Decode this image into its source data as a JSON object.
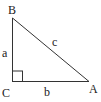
{
  "diagram": {
    "type": "right-triangle",
    "vertices": [
      {
        "id": "B",
        "label": "B",
        "x": 12,
        "y": 18
      },
      {
        "id": "C",
        "label": "C",
        "x": 12,
        "y": 81
      },
      {
        "id": "A",
        "label": "A",
        "x": 89,
        "y": 81
      }
    ],
    "sides": [
      {
        "id": "a",
        "label": "a",
        "from": "B",
        "to": "C"
      },
      {
        "id": "b",
        "label": "b",
        "from": "C",
        "to": "A"
      },
      {
        "id": "c",
        "label": "c",
        "from": "B",
        "to": "A"
      }
    ],
    "right_angle_at": "C",
    "stroke_color": "#333333"
  }
}
